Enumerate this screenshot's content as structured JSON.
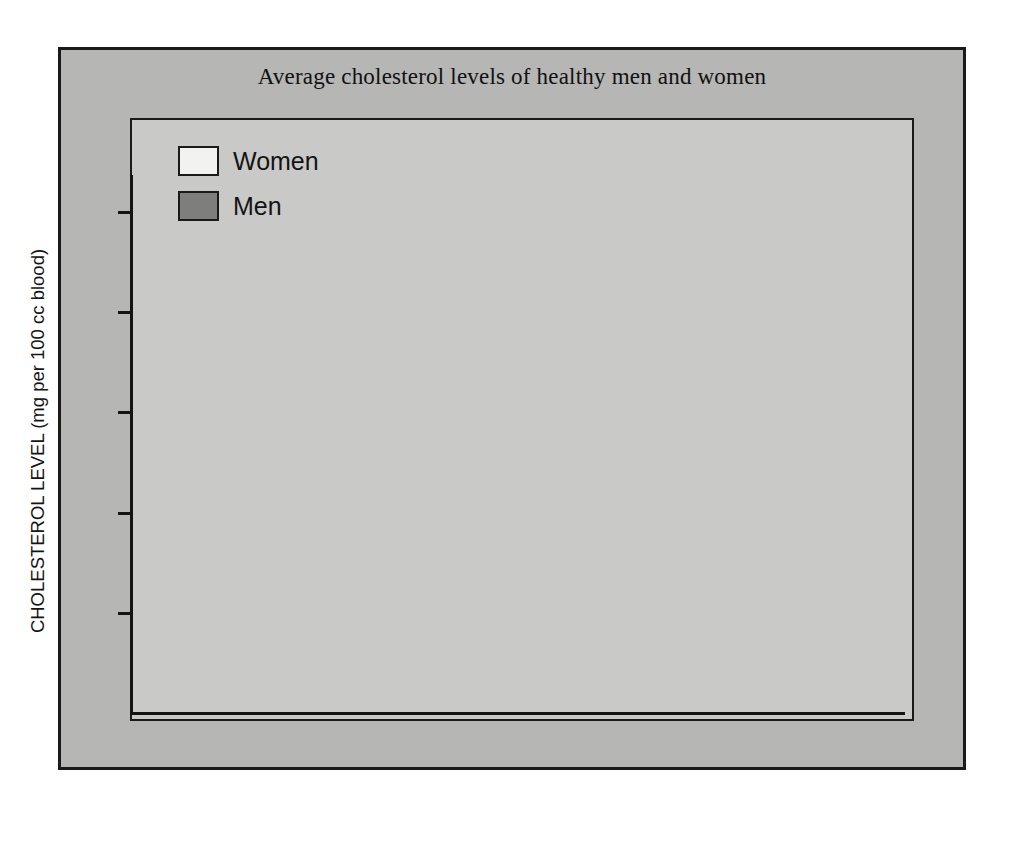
{
  "chart_data": {
    "type": "bar",
    "title": "Average cholesterol levels of healthy men and women",
    "xlabel_prefix": "Age",
    "xlabel_suffix": "years",
    "ylabel": "CHOLESTEROL LEVEL (mg per 100 cc blood)",
    "categories": [
      "25-29",
      "30-34",
      "35-39",
      "40-44",
      "45-49",
      "50-54",
      "55-59",
      "60-64"
    ],
    "series": [
      {
        "name": "Women",
        "values": [
          177,
          205,
          202,
          198,
          227,
          233,
          237,
          243
        ],
        "color": "#f2f2f0"
      },
      {
        "name": "Men",
        "values": [
          192,
          195,
          214,
          219,
          217,
          215,
          195,
          208
        ],
        "color": "#7e7e7c"
      }
    ],
    "ylim": [
      0,
      280
    ],
    "yticks": [
      0,
      50,
      100,
      150,
      200,
      250
    ],
    "ytick_labels": [
      "0",
      "50",
      "100",
      "150",
      "200",
      "250"
    ],
    "grid": false,
    "legend_position": "top-left",
    "style": "3d-isometric-bars"
  },
  "legend": {
    "items": [
      {
        "label": "Women",
        "color": "#f2f2f0"
      },
      {
        "label": "Men",
        "color": "#7e7e7c"
      }
    ]
  },
  "colors": {
    "page_background": "#ffffff",
    "card_background": "#b6b6b4",
    "plot_background": "#c9c9c7",
    "axis": "#141414",
    "women_front": "#f2f2f0",
    "women_side": "#cfcfcd",
    "men_front": "#7e7e7c",
    "men_side": "#6c6c6a"
  }
}
